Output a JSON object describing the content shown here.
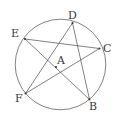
{
  "figure": {
    "background_color": "#ffffff",
    "stroke_color": "#4a4a4a",
    "label_color": "#3b3b3b",
    "stroke_width": 0.7,
    "circle": {
      "name": "circumscribed-circle",
      "center_x": 60.5,
      "center_y": 64.5,
      "radius": 45.3
    },
    "center_point": {
      "label": "A",
      "x": 56,
      "y": 67,
      "label_x": 57,
      "label_y": 55
    },
    "vertices": [
      {
        "label": "B",
        "x": 89.5,
        "y": 99.5,
        "label_x": 89,
        "label_y": 101
      },
      {
        "label": "C",
        "x": 99.5,
        "y": 48.5,
        "label_x": 103,
        "label_y": 43
      },
      {
        "label": "D",
        "x": 72.5,
        "y": 23.0,
        "label_x": 68,
        "label_y": 10
      },
      {
        "label": "E",
        "x": 25.0,
        "y": 39.0,
        "label_x": 11,
        "label_y": 28
      },
      {
        "label": "F",
        "x": 25.5,
        "y": 93.5,
        "label_x": 15,
        "label_y": 93
      }
    ],
    "chords": [
      {
        "name": "chord-D-F",
        "from": "D",
        "to": "F"
      },
      {
        "name": "chord-F-C",
        "from": "F",
        "to": "C"
      },
      {
        "name": "chord-C-E",
        "from": "C",
        "to": "E"
      },
      {
        "name": "chord-E-B",
        "from": "E",
        "to": "B"
      },
      {
        "name": "chord-B-D",
        "from": "B",
        "to": "D"
      }
    ],
    "point_marker_size": 1.7
  }
}
